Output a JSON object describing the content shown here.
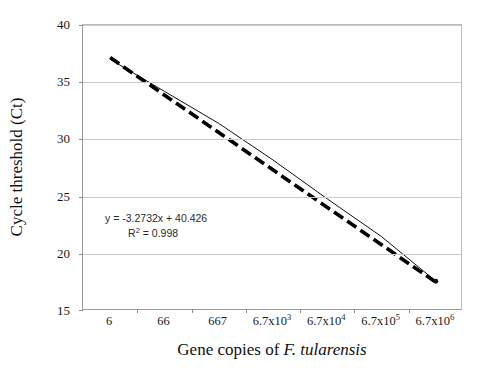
{
  "figure": {
    "background_color": "#ffffff",
    "plot_border_color": "#9a9a9a",
    "gridline_color": "#c9c9c9",
    "series_color": "#000000",
    "trendline_color": "#000000"
  },
  "chart_data": {
    "type": "line",
    "title": "",
    "xlabel": "Gene copies of F. tularensis",
    "xlabel_parts": {
      "prefix": "Gene copies of ",
      "italic": "F. tularensis"
    },
    "ylabel": "Cycle threshold (Ct)",
    "categories": [
      "6",
      "66",
      "667",
      "6.7x10³",
      "6.7x10⁴",
      "6.7x10⁵",
      "6.7x10⁶"
    ],
    "category_labels": [
      {
        "base": "6",
        "exp": ""
      },
      {
        "base": "66",
        "exp": ""
      },
      {
        "base": "667",
        "exp": ""
      },
      {
        "base": "6.7x10",
        "exp": "3"
      },
      {
        "base": "6.7x10",
        "exp": "4"
      },
      {
        "base": "6.7x10",
        "exp": "5"
      },
      {
        "base": "6.7x10",
        "exp": "6"
      }
    ],
    "values": [
      37.0,
      34.2,
      31.4,
      28.2,
      24.8,
      21.5,
      17.6
    ],
    "ylim": [
      15,
      40
    ],
    "yticks": [
      15,
      20,
      25,
      30,
      35,
      40
    ],
    "ytick_labels": [
      "15",
      "20",
      "25",
      "30",
      "35",
      "40"
    ],
    "grid": "horizontal",
    "legend": "none",
    "series": [
      {
        "name": "Ct data",
        "style": "solid-thin-with-end-marker",
        "values": [
          37.0,
          34.2,
          31.4,
          28.2,
          24.8,
          21.5,
          17.6
        ]
      },
      {
        "name": "Linear trendline",
        "style": "thick-dashed",
        "equation": "y = -3.2732x + 40.426",
        "slope": -3.2732,
        "intercept": 40.426,
        "r_squared": 0.998
      }
    ],
    "annotations": [
      {
        "name": "regression-equation",
        "line1": "y = -3.2732x + 40.426",
        "line2_base": "R",
        "line2_exp": "2",
        "line2_rest": " = 0.998"
      }
    ]
  },
  "caption": {
    "text": ""
  }
}
